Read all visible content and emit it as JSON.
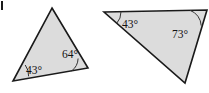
{
  "figure": {
    "background_color": "#ffffff",
    "fill_color": "#dcdcdc",
    "stroke_color": "#1a1a1a",
    "arc_color": "#333333",
    "label_color": "#111111",
    "corner_mark": {
      "name": "cropped-label-mark",
      "color": "#1a1a1a"
    },
    "shapes": [
      {
        "name": "left-triangle",
        "points": "52,8 88,68 13,81",
        "angles": [
          {
            "name": "angle-43-left-triangle",
            "label": "43°",
            "value": 43,
            "vertex_x": 13,
            "vertex_y": 81,
            "text_x": 26,
            "text_y": 71,
            "arc_path": "M 28.6,76.3 A 17,17 0 0 0 25.2,65.0"
          },
          {
            "name": "angle-64-left-triangle",
            "label": "64°",
            "value": 64,
            "vertex_x": 88,
            "vertex_y": 68,
            "text_x": 62,
            "text_y": 55,
            "arc_path": "M 71.7,70.9 A 16.5,16.5 0 0 0 78.1,58.5"
          }
        ]
      },
      {
        "name": "right-triangle",
        "points": "104,12 207,10 185,83",
        "angles": [
          {
            "name": "angle-43-right-triangle",
            "label": "43°",
            "value": 43,
            "vertex_x": 104,
            "vertex_y": 12,
            "text_x": 122,
            "text_y": 25,
            "arc_path": "M 121,11.7 A 17,17 0 0 1 116.5,23.6"
          },
          {
            "name": "angle-73-right-triangle",
            "label": "73°",
            "value": 73,
            "vertex_x": 207,
            "vertex_y": 10,
            "text_x": 172,
            "text_y": 35,
            "arc_path": "M 190,10.3 A 17,17 0 0 1 201.2,25.6"
          }
        ]
      }
    ]
  }
}
